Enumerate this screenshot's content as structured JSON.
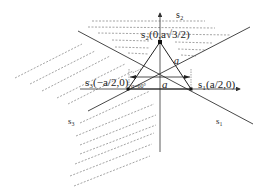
{
  "diagram": {
    "labels": {
      "s2_axis": "s₂",
      "s1_axis": "s₁",
      "s3_axis": "s₃",
      "s2_point": "s₂(0,a√3/2)",
      "s3_point": "s₃(−a/2,0)",
      "s1_point": "s₁(a/2,0)",
      "side_a": "a",
      "side_a2": "a",
      "angle": "α=60°"
    },
    "colors": {
      "line": "#333333",
      "dashed": "#555555",
      "background": "#ffffff"
    }
  }
}
